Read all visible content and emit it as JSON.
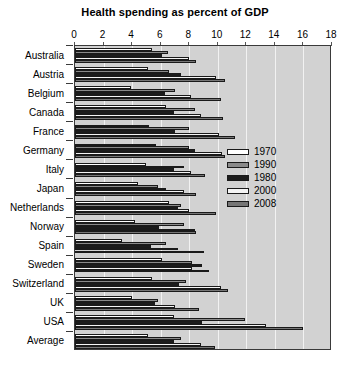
{
  "chart_data": {
    "type": "bar",
    "orientation": "horizontal",
    "title": "Health spending as percent of GDP",
    "xlabel": "",
    "ylabel": "",
    "xlim": [
      0,
      18
    ],
    "xticks": [
      0,
      2,
      4,
      6,
      8,
      10,
      12,
      14,
      16,
      18
    ],
    "grid": true,
    "legend_position": "middle-right-inside",
    "categories": [
      "Australia",
      "Austria",
      "Belgium",
      "Canada",
      "France",
      "Germany",
      "Italy",
      "Japan",
      "Netherlands",
      "Norway",
      "Spain",
      "Sweden",
      "Switzerland",
      "UK",
      "USA",
      "Average"
    ],
    "series": [
      {
        "name": "1970",
        "color": "#ffffff",
        "values": [
          5.4,
          5.1,
          3.9,
          6.4,
          5.2,
          5.7,
          5.0,
          4.4,
          6.6,
          4.2,
          3.3,
          6.1,
          5.4,
          4.0,
          6.9,
          5.1
        ]
      },
      {
        "name": "1990",
        "color": "#8a8a8a",
        "values": [
          6.5,
          6.6,
          7.0,
          8.4,
          8.0,
          8.0,
          7.6,
          5.8,
          7.4,
          7.6,
          6.4,
          8.2,
          7.8,
          5.8,
          11.9,
          7.4
        ]
      },
      {
        "name": "1980",
        "color": "#1c1c1c",
        "values": [
          6.1,
          7.4,
          6.3,
          6.9,
          7.0,
          8.4,
          6.9,
          6.4,
          7.2,
          5.9,
          5.3,
          8.9,
          7.3,
          5.6,
          8.9,
          6.9
        ]
      },
      {
        "name": "2000",
        "color": "#f4f4f4",
        "values": [
          8.0,
          9.9,
          8.1,
          8.8,
          10.1,
          10.3,
          8.1,
          7.6,
          8.0,
          8.4,
          7.2,
          8.2,
          10.2,
          7.0,
          13.4,
          8.8
        ]
      },
      {
        "name": "2008",
        "color": "#767676",
        "values": [
          8.5,
          10.5,
          10.2,
          10.4,
          11.2,
          10.5,
          9.1,
          8.5,
          9.9,
          8.5,
          9.0,
          9.4,
          10.7,
          8.7,
          16.0,
          9.8
        ]
      }
    ],
    "legend_order": [
      "1970",
      "1990",
      "1980",
      "2000",
      "2008"
    ]
  },
  "colors": {
    "plot_background": "#d2d2d2",
    "gridline": "#f2f2f2",
    "axis": "#3a3a3a",
    "text": "#000000"
  }
}
